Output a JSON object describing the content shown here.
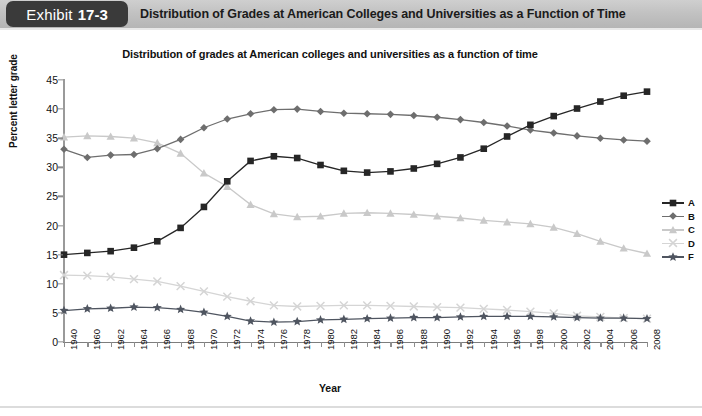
{
  "header": {
    "exhibit_word": "Exhibit",
    "exhibit_number": "17-3",
    "title": "Distribution of Grades at American Colleges and Universities as a Function of Time",
    "badge_color": "#3a3a3a",
    "bar_color": "#c2c2c2"
  },
  "chart_data": {
    "type": "line",
    "title": "Distribution of grades at American colleges and universities as a function of time",
    "xlabel": "Year",
    "ylabel": "Percent letter grade",
    "ylim": [
      0,
      45
    ],
    "yticks": [
      0,
      5,
      10,
      15,
      20,
      25,
      30,
      35,
      40,
      45
    ],
    "grid": false,
    "legend_position": "right",
    "categories": [
      "1940",
      "1960",
      "1962",
      "1964",
      "1966",
      "1968",
      "1970",
      "1972",
      "1974",
      "1976",
      "1978",
      "1980",
      "1982",
      "1984",
      "1986",
      "1988",
      "1990",
      "1992",
      "1994",
      "1996",
      "1998",
      "2000",
      "2002",
      "2004",
      "2006",
      "2008"
    ],
    "series": [
      {
        "name": "A",
        "marker": "square",
        "color": "#262626",
        "values": [
          15.0,
          15.3,
          15.6,
          16.2,
          17.3,
          19.6,
          23.2,
          27.6,
          31.1,
          31.9,
          31.6,
          30.4,
          29.4,
          29.1,
          29.3,
          29.8,
          30.6,
          31.7,
          33.2,
          35.3,
          37.3,
          38.8,
          40.1,
          41.3,
          42.3,
          43.0
        ]
      },
      {
        "name": "B",
        "marker": "diamond",
        "color": "#6e6e6e",
        "values": [
          33.1,
          31.7,
          32.1,
          32.2,
          33.2,
          34.8,
          36.8,
          38.3,
          39.2,
          39.9,
          40.0,
          39.6,
          39.3,
          39.2,
          39.1,
          38.9,
          38.6,
          38.2,
          37.7,
          37.1,
          36.4,
          35.9,
          35.4,
          35.0,
          34.7,
          34.5
        ]
      },
      {
        "name": "C",
        "marker": "triangle",
        "color": "#c9c9c9",
        "values": [
          35.2,
          35.4,
          35.3,
          35.0,
          34.2,
          32.4,
          29.0,
          26.7,
          23.6,
          22.0,
          21.5,
          21.6,
          22.1,
          22.2,
          22.1,
          21.9,
          21.6,
          21.3,
          20.9,
          20.6,
          20.3,
          19.7,
          18.6,
          17.3,
          16.1,
          15.2
        ]
      },
      {
        "name": "D",
        "marker": "x",
        "color": "#d5d5d5",
        "values": [
          11.5,
          11.4,
          11.2,
          10.8,
          10.4,
          9.6,
          8.7,
          7.8,
          7.0,
          6.3,
          6.1,
          6.2,
          6.3,
          6.3,
          6.2,
          6.1,
          6.0,
          5.9,
          5.7,
          5.5,
          5.2,
          4.9,
          4.5,
          4.3,
          4.1,
          4.0
        ]
      },
      {
        "name": "F",
        "marker": "star",
        "color": "#4f5560",
        "values": [
          5.4,
          5.7,
          5.8,
          6.0,
          5.9,
          5.6,
          5.1,
          4.4,
          3.6,
          3.4,
          3.5,
          3.8,
          3.9,
          4.0,
          4.1,
          4.2,
          4.2,
          4.3,
          4.4,
          4.4,
          4.4,
          4.3,
          4.2,
          4.1,
          4.1,
          4.0
        ]
      }
    ]
  },
  "legend": {
    "items": [
      {
        "label": "A"
      },
      {
        "label": "B"
      },
      {
        "label": "C"
      },
      {
        "label": "D"
      },
      {
        "label": "F"
      }
    ]
  }
}
